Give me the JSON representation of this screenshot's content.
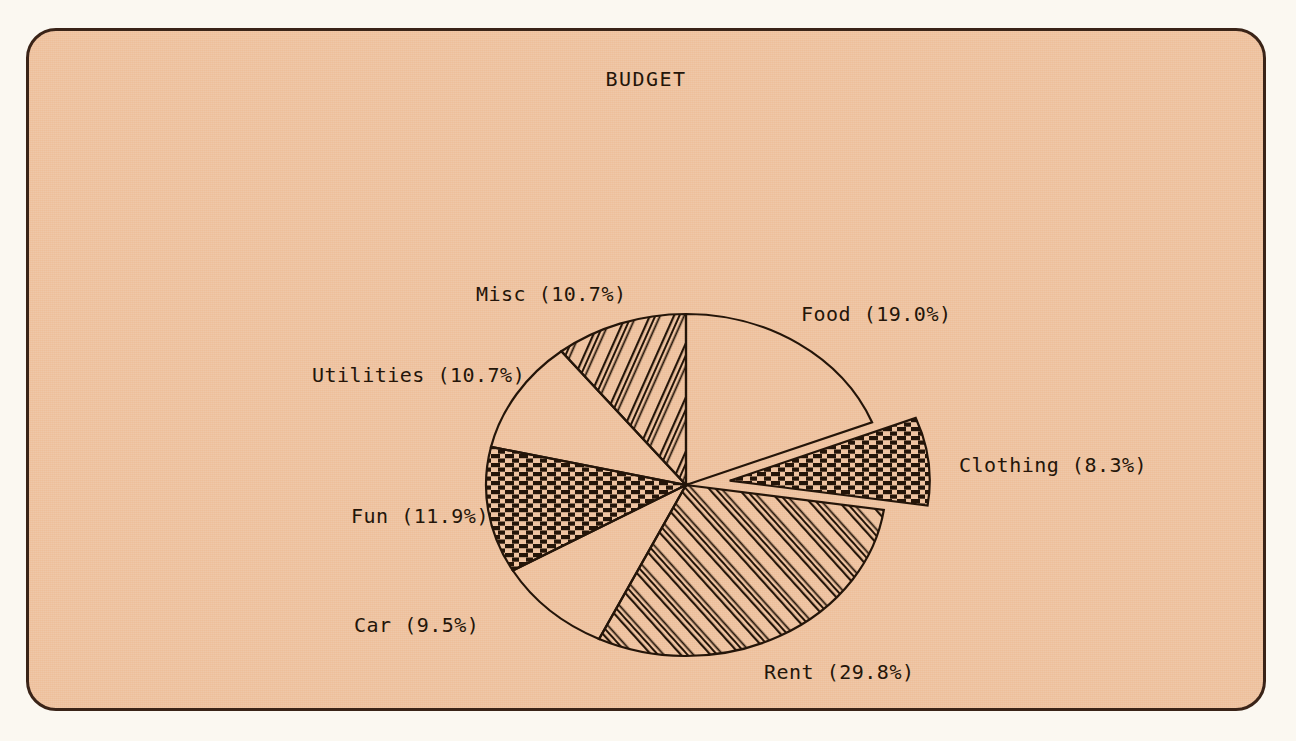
{
  "chart_data": {
    "type": "pie",
    "title": "BUDGET",
    "xlabel": "",
    "ylabel": "",
    "legend_position": "none",
    "grid": false,
    "labels": [
      "Food",
      "Clothing",
      "Rent",
      "Car",
      "Fun",
      "Utilities",
      "Misc"
    ],
    "values": [
      19.0,
      8.3,
      29.8,
      9.5,
      11.9,
      10.7,
      10.7
    ],
    "value_unit": "%",
    "start_angle_deg": 90,
    "direction": "clockwise",
    "exploded_slices": [
      "Clothing"
    ],
    "slices": [
      {
        "label": "Food",
        "percent": 19.0,
        "label_text": "Food (19.0%)",
        "fill": "none",
        "exploded": false,
        "label_x": 772,
        "label_y": 290
      },
      {
        "label": "Clothing",
        "percent": 8.3,
        "label_text": "Clothing (8.3%)",
        "fill": "dense-horizontal-hatch",
        "exploded": true,
        "label_x": 930,
        "label_y": 441
      },
      {
        "label": "Rent",
        "percent": 29.8,
        "label_text": "Rent (29.8%)",
        "fill": "diagonal-hatch",
        "exploded": false,
        "label_x": 735,
        "label_y": 648
      },
      {
        "label": "Car",
        "percent": 9.5,
        "label_text": "Car (9.5%)",
        "fill": "none",
        "exploded": false,
        "label_x": 325,
        "label_y": 601
      },
      {
        "label": "Fun",
        "percent": 11.9,
        "label_text": "Fun (11.9%)",
        "fill": "dense-horizontal-hatch",
        "exploded": false,
        "label_x": 322,
        "label_y": 492
      },
      {
        "label": "Utilities",
        "percent": 10.7,
        "label_text": "Utilities (10.7%)",
        "fill": "none",
        "exploded": false,
        "label_x": 283,
        "label_y": 351
      },
      {
        "label": "Misc",
        "percent": 10.7,
        "label_text": "Misc (10.7%)",
        "fill": "diagonal-hatch",
        "exploded": false,
        "label_x": 447,
        "label_y": 270
      }
    ]
  },
  "colors": {
    "paper": "#faf7f0",
    "plot_background": "#eebf9a",
    "ink": "#241509",
    "frame_border": "#3a2418"
  },
  "geometry": {
    "center_x": 657,
    "center_y": 454,
    "radius_x": 200,
    "radius_y": 171,
    "explode_offset": 44
  }
}
